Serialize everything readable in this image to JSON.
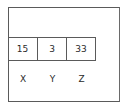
{
  "diagram": {
    "values": [
      {
        "label": "X",
        "value": "15"
      },
      {
        "label": "Y",
        "value": "3"
      },
      {
        "label": "Z",
        "value": "33"
      }
    ]
  }
}
